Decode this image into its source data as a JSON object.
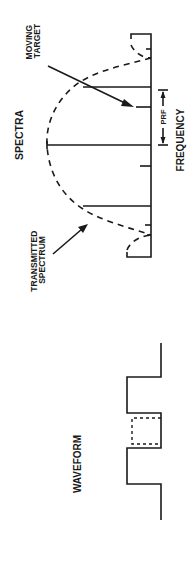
{
  "figure": {
    "colors": {
      "ink": "#1a1a1a",
      "background": "#ffffff"
    },
    "spectra": {
      "title": "SPECTRA",
      "annotations": {
        "moving_target": [
          "MOVING",
          "TARGET"
        ],
        "transmitted_spectrum": [
          "TRANSMITTED",
          "SPECTRUM"
        ],
        "prf": "PRF"
      },
      "axis_label": "FREQUENCY"
    },
    "waveform": {
      "title": "WAVEFORM"
    }
  }
}
